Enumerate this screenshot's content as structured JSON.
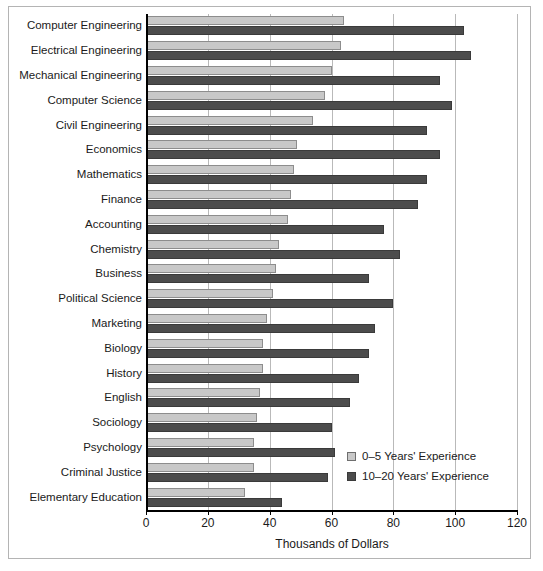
{
  "chart_data": {
    "type": "bar",
    "orientation": "horizontal",
    "title": "",
    "xlabel": "Thousands of Dollars",
    "ylabel": "",
    "xlim": [
      0,
      120
    ],
    "xticks": [
      0,
      20,
      40,
      60,
      80,
      100,
      120
    ],
    "xtick_labels": [
      "0",
      "20",
      "40",
      "60",
      "80",
      "100",
      "120"
    ],
    "grid": "vertical",
    "legend_position": "inside-lower-right",
    "categories": [
      "Computer Engineering",
      "Electrical Engineering",
      "Mechanical Engineering",
      "Computer Science",
      "Civil Engineering",
      "Economics",
      "Mathematics",
      "Finance",
      "Accounting",
      "Chemistry",
      "Business",
      "Political Science",
      "Marketing",
      "Biology",
      "History",
      "English",
      "Sociology",
      "Psychology",
      "Criminal Justice",
      "Elementary Education"
    ],
    "series": [
      {
        "name": "0–5 Years' Experience",
        "color": "#c8c8c8",
        "values": [
          64,
          63,
          60,
          58,
          54,
          49,
          48,
          47,
          46,
          43,
          42,
          41,
          39,
          38,
          38,
          37,
          36,
          35,
          35,
          32
        ]
      },
      {
        "name": "10–20 Years' Experience",
        "color": "#4c4c4c",
        "values": [
          103,
          105,
          95,
          99,
          91,
          95,
          91,
          88,
          77,
          82,
          72,
          80,
          74,
          72,
          69,
          66,
          60,
          61,
          59,
          44
        ]
      }
    ]
  },
  "legend": {
    "items": [
      {
        "label": "0–5 Years' Experience",
        "swatch": "light"
      },
      {
        "label": "10–20 Years' Experience",
        "swatch": "dark"
      }
    ]
  }
}
